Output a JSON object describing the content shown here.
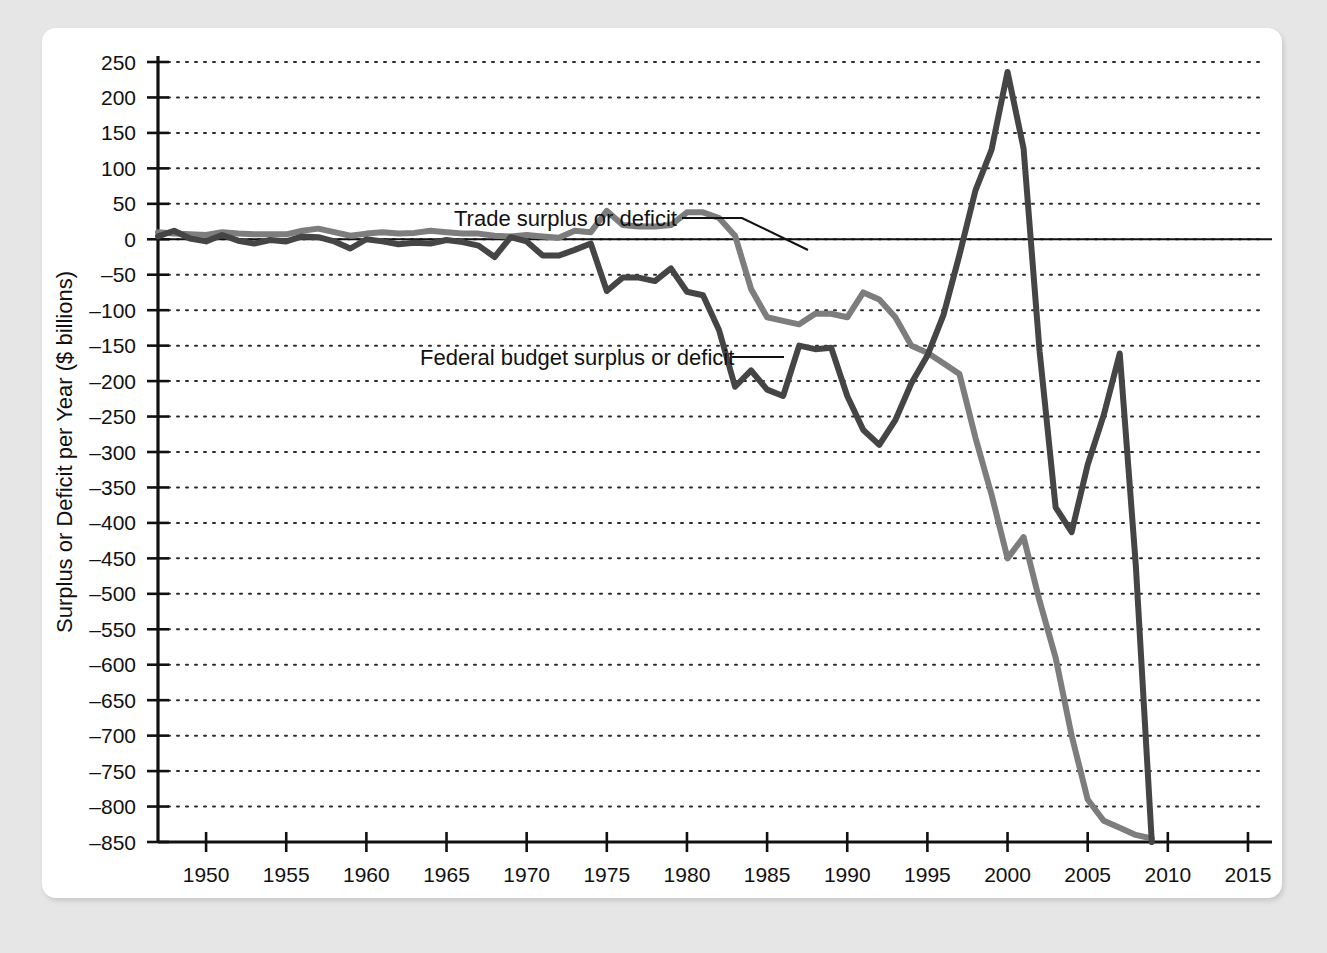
{
  "figure": {
    "background_color": "#e6e6e6",
    "panel_color": "#ffffff"
  },
  "chart_data": {
    "type": "line",
    "title": "",
    "xlabel": "Year",
    "ylabel": "Surplus or Deficit per Year ($ billions)",
    "xlim": [
      1947,
      2016
    ],
    "ylim": [
      -850,
      250
    ],
    "grid": true,
    "grid_style": "dotted-horizontal",
    "legend_position": "inline-annotations",
    "xticks": [
      1950,
      1955,
      1960,
      1965,
      1970,
      1975,
      1980,
      1985,
      1990,
      1995,
      2000,
      2005,
      2010,
      2015
    ],
    "xtick_labels": [
      "1950",
      "1955",
      "1960",
      "1965",
      "1970",
      "1975",
      "1980",
      "1985",
      "1990",
      "1995",
      "2000",
      "2005",
      "2010",
      "2015"
    ],
    "yticks": [
      250,
      200,
      150,
      100,
      50,
      0,
      -50,
      -100,
      -150,
      -200,
      -250,
      -300,
      -350,
      -400,
      -450,
      -500,
      -550,
      -600,
      -650,
      -700,
      -750,
      -800,
      -850
    ],
    "ytick_labels": [
      "250",
      "200",
      "150",
      "100",
      "50",
      "0",
      "–50",
      "–100",
      "–150",
      "–200",
      "–250",
      "–300",
      "–350",
      "–400",
      "–450",
      "–500",
      "–550",
      "–600",
      "–650",
      "–700",
      "–750",
      "–800",
      "–850"
    ],
    "zero_line": 0,
    "series": [
      {
        "name": "Trade surplus or deficit",
        "color": "#7d7d7d",
        "line_width": 6,
        "x": [
          1947,
          1948,
          1949,
          1950,
          1951,
          1952,
          1953,
          1954,
          1955,
          1956,
          1957,
          1958,
          1959,
          1960,
          1961,
          1962,
          1963,
          1964,
          1965,
          1966,
          1967,
          1968,
          1969,
          1970,
          1971,
          1972,
          1973,
          1974,
          1975,
          1976,
          1977,
          1978,
          1979,
          1980,
          1981,
          1982,
          1983,
          1984,
          1985,
          1986,
          1987,
          1988,
          1989,
          1990,
          1991,
          1992,
          1993,
          1994,
          1995,
          1996,
          1997,
          1998,
          1999,
          2000,
          2001,
          2002,
          2003,
          2004,
          2005,
          2006,
          2007,
          2008,
          2009
        ],
        "y": [
          10,
          8,
          7,
          6,
          10,
          8,
          7,
          7,
          7,
          12,
          15,
          10,
          5,
          8,
          10,
          8,
          9,
          12,
          10,
          8,
          8,
          5,
          4,
          6,
          4,
          2,
          12,
          10,
          40,
          20,
          18,
          18,
          20,
          38,
          38,
          30,
          5,
          -70,
          -110,
          -115,
          -120,
          -105,
          -105,
          -110,
          -75,
          -85,
          -110,
          -150,
          -160,
          -175,
          -190,
          -280,
          -360,
          -450,
          -420,
          -510,
          -590,
          -700,
          -790,
          -820,
          -830,
          -840,
          -845
        ]
      },
      {
        "name": "Federal budget surplus or deficit",
        "color": "#454545",
        "line_width": 6,
        "x": [
          1947,
          1948,
          1949,
          1950,
          1951,
          1952,
          1953,
          1954,
          1955,
          1956,
          1957,
          1958,
          1959,
          1960,
          1961,
          1962,
          1963,
          1964,
          1965,
          1966,
          1967,
          1968,
          1969,
          1970,
          1971,
          1972,
          1973,
          1974,
          1975,
          1976,
          1977,
          1978,
          1979,
          1980,
          1981,
          1982,
          1983,
          1984,
          1985,
          1986,
          1987,
          1988,
          1989,
          1990,
          1991,
          1992,
          1993,
          1994,
          1995,
          1996,
          1997,
          1998,
          1999,
          2000,
          2001,
          2002,
          2003,
          2004,
          2005,
          2006,
          2007,
          2008,
          2009
        ],
        "y": [
          4,
          12,
          1,
          -3,
          6,
          -2,
          -6,
          -1,
          -3,
          4,
          3,
          -3,
          -13,
          0,
          -3,
          -7,
          -5,
          -6,
          -1,
          -4,
          -9,
          -25,
          3,
          -3,
          -23,
          -23,
          -15,
          -6,
          -73,
          -54,
          -54,
          -59,
          -41,
          -74,
          -79,
          -128,
          -208,
          -185,
          -212,
          -221,
          -150,
          -155,
          -153,
          -221,
          -269,
          -290,
          -255,
          -203,
          -164,
          -107,
          -22,
          69,
          126,
          236,
          128,
          -158,
          -378,
          -413,
          -318,
          -248,
          -161,
          -459,
          -850
        ]
      }
    ],
    "annotations": [
      {
        "id": "trade-annotation",
        "text": "Trade surplus or deficit",
        "text_x": 412,
        "text_y": 198,
        "leader": [
          [
            640,
            190
          ],
          [
            700,
            190
          ],
          [
            766,
            222
          ]
        ]
      },
      {
        "id": "budget-annotation",
        "text": "Federal budget surplus or deficit",
        "text_x": 378,
        "text_y": 337,
        "leader": [
          [
            690,
            329
          ],
          [
            742,
            329
          ]
        ]
      }
    ]
  }
}
